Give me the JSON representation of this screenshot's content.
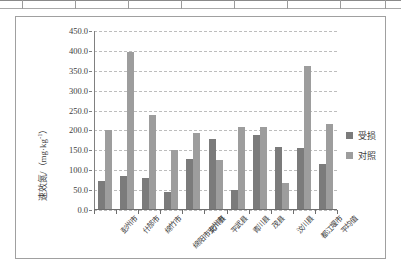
{
  "chart_data": {
    "type": "bar",
    "title": "",
    "subtitle": "",
    "xlabel": "",
    "ylabel": "速效氮/（mg·kg-1）",
    "ylabel_base": "速效氮/（mg·kg",
    "ylabel_sup": "-1",
    "ylabel_tail": "）",
    "ylim": [
      0,
      450
    ],
    "ytick_step": 50,
    "grid": true,
    "legend_position": "right",
    "categories": [
      "彭州市",
      "什邡市",
      "绵竹市",
      "绵阳市安州市",
      "北川县",
      "平武县",
      "青川县",
      "茂县",
      "汶川县",
      "都江堰市",
      "平均值"
    ],
    "ytick_labels": [
      "0.0",
      "50.0",
      "100.0",
      "150.0",
      "200.0",
      "250.0",
      "300.0",
      "350.0",
      "400.0",
      "450.0"
    ],
    "ytick_values": [
      0,
      50,
      100,
      150,
      200,
      250,
      300,
      350,
      400,
      450
    ],
    "series": [
      {
        "name": "受损",
        "color": "#7b7b7b",
        "values": [
          72,
          85,
          81,
          46,
          127,
          178,
          50,
          188,
          159,
          155,
          116
        ]
      },
      {
        "name": "对照",
        "color": "#9d9d9d",
        "values": [
          202,
          397,
          240,
          152,
          193,
          126,
          208,
          209,
          69,
          361,
          217
        ]
      }
    ]
  },
  "legend": {
    "items": [
      {
        "label": "受损"
      },
      {
        "label": "对照"
      }
    ]
  }
}
